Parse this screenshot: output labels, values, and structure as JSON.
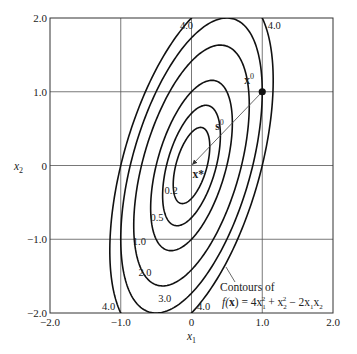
{
  "chart_data": {
    "type": "contour",
    "function_label": "f(x) = 4x1^2 + x2^2 - 2x1x2",
    "annotation": {
      "line1": "Contours of",
      "line2_prefix": "f(",
      "line2_bold": "x",
      "line2_suffix": ") = 4x",
      "sub1": "1",
      "sup1": "2",
      "plus": " + x",
      "sub2": "2",
      "sup2": "2",
      "minus": " − 2x",
      "sub3": "1",
      "x2": "x",
      "sub4": "2"
    },
    "xlabel": "x",
    "xlabel_sub": "1",
    "ylabel": "x",
    "ylabel_sub": "2",
    "xlim": [
      -2.0,
      2.0
    ],
    "ylim": [
      -2.0,
      2.0
    ],
    "xticks": [
      -2.0,
      -1.0,
      0,
      1.0,
      2.0
    ],
    "xtick_labels": [
      "−2.0",
      "−1.0",
      "0",
      "1.0",
      "2.0"
    ],
    "yticks": [
      2.0,
      1.0,
      0,
      -1.0,
      -2.0
    ],
    "ytick_labels": [
      "2.0",
      "1.0",
      "0",
      "−1.0",
      "−2.0"
    ],
    "grid": true,
    "levels": [
      0.2,
      0.5,
      1.0,
      2.0,
      3.0,
      4.0
    ],
    "level_labels": [
      "0.2",
      "0.5",
      "1.0",
      "2.0",
      "3.0",
      "4.0"
    ],
    "minimum": {
      "label": "x*",
      "x": 0,
      "y": 0
    },
    "start_point": {
      "label": "x",
      "sup": "0",
      "x": 1.0,
      "y": 1.0
    },
    "direction": {
      "label": "s",
      "sup": "0"
    }
  }
}
